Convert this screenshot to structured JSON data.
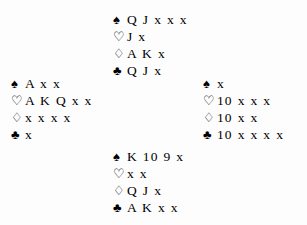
{
  "diagram": {
    "layout": "cross",
    "ink_color": "#000000",
    "background_color": "#fdfdfd",
    "suit_glyphs": {
      "spade": "♠",
      "heart": "♡",
      "diamond": "♢",
      "club": "♣"
    },
    "hands": {
      "north": {
        "position_label": "North",
        "suits": [
          {
            "suit": "spade",
            "symbol": "♠",
            "filled": true,
            "cards": "Q J x x x"
          },
          {
            "suit": "heart",
            "symbol": "♡",
            "filled": false,
            "cards": "J x"
          },
          {
            "suit": "diamond",
            "symbol": "♢",
            "filled": false,
            "cards": "A K x"
          },
          {
            "suit": "club",
            "symbol": "♣",
            "filled": true,
            "cards": "Q J x"
          }
        ]
      },
      "west": {
        "position_label": "West",
        "suits": [
          {
            "suit": "spade",
            "symbol": "♠",
            "filled": true,
            "cards": "A x x"
          },
          {
            "suit": "heart",
            "symbol": "♡",
            "filled": false,
            "cards": "A K Q x x"
          },
          {
            "suit": "diamond",
            "symbol": "♢",
            "filled": false,
            "cards": "x x x x"
          },
          {
            "suit": "club",
            "symbol": "♣",
            "filled": true,
            "cards": "x"
          }
        ]
      },
      "east": {
        "position_label": "East",
        "suits": [
          {
            "suit": "spade",
            "symbol": "♠",
            "filled": true,
            "cards": "x"
          },
          {
            "suit": "heart",
            "symbol": "♡",
            "filled": false,
            "cards": "10 x x x"
          },
          {
            "suit": "diamond",
            "symbol": "♢",
            "filled": false,
            "cards": "10 x x"
          },
          {
            "suit": "club",
            "symbol": "♣",
            "filled": true,
            "cards": "10 x x x x"
          }
        ]
      },
      "south": {
        "position_label": "South",
        "suits": [
          {
            "suit": "spade",
            "symbol": "♠",
            "filled": true,
            "cards": "K 10 9 x"
          },
          {
            "suit": "heart",
            "symbol": "♡",
            "filled": false,
            "cards": "x x"
          },
          {
            "suit": "diamond",
            "symbol": "♢",
            "filled": false,
            "cards": "Q J x"
          },
          {
            "suit": "club",
            "symbol": "♣",
            "filled": true,
            "cards": "A K x x"
          }
        ]
      }
    }
  }
}
